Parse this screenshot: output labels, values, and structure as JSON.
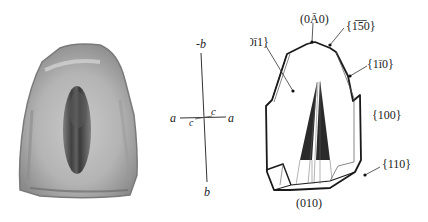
{
  "photo": {
    "description": "grayscale micrograph of crystal section with dark central sector"
  },
  "axes": {
    "labels": {
      "top": "-b",
      "bottom": "b",
      "left": "a",
      "right": "a",
      "c_upper": "c",
      "c_lower": "c"
    }
  },
  "crystal": {
    "face_labels": {
      "f010_neg": "(0Ā0)",
      "f150": "{1̅5̅0}",
      "f0_11": "{0ī1}",
      "f1_10": "{1ī0}",
      "f100": "{100}",
      "f110": "{110}",
      "f010": "(010)"
    },
    "colors": {
      "outline": "#1a1a1a",
      "sector": "#2a2a2a"
    }
  }
}
